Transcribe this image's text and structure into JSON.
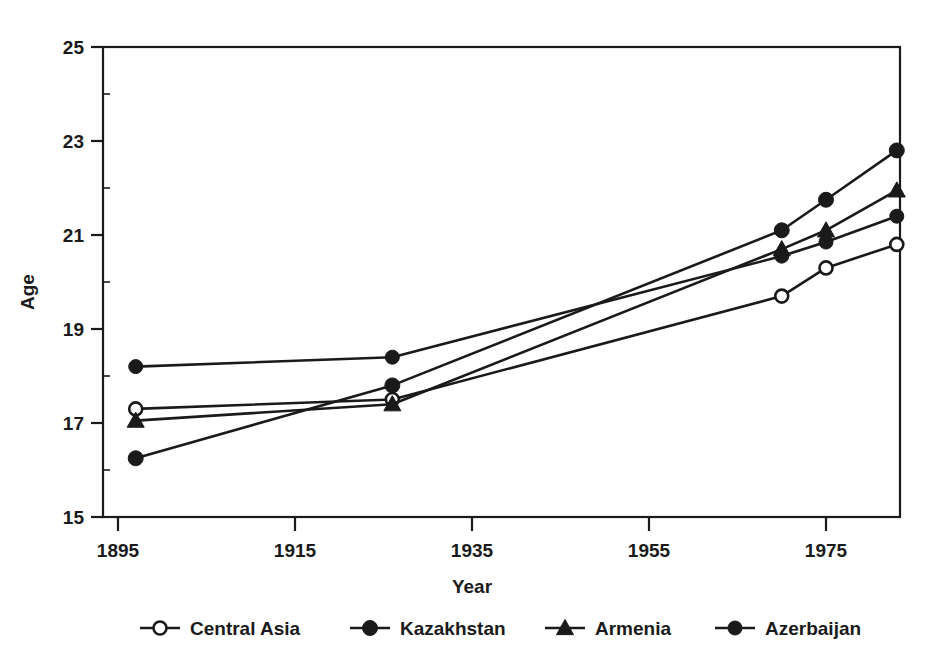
{
  "chart_data": {
    "type": "line",
    "title": "",
    "subtitle": "",
    "xlabel": "Year",
    "ylabel": "Age",
    "xlim": [
      1895,
      1985
    ],
    "ylim": [
      15,
      25
    ],
    "xticks": [
      1895,
      1915,
      1935,
      1955,
      1975
    ],
    "xtick_labels": [
      "1895",
      "1915",
      "1935",
      "1955",
      "1975"
    ],
    "yticks": [
      15,
      17,
      19,
      21,
      23,
      25
    ],
    "ytick_labels": [
      "15",
      "17",
      "19",
      "21",
      "23",
      "25"
    ],
    "grid": false,
    "legend_position": "bottom",
    "x": [
      1897,
      1926,
      1970,
      1975,
      1983
    ],
    "series": [
      {
        "name": "Central Asia",
        "marker": "open-circle",
        "values": [
          17.3,
          17.5,
          19.7,
          20.3,
          20.8
        ]
      },
      {
        "name": "Kazakhstan",
        "marker": "filled-circle",
        "values": [
          16.25,
          17.8,
          21.1,
          21.75,
          22.8
        ]
      },
      {
        "name": "Armenia",
        "marker": "filled-triangle",
        "values": [
          17.05,
          17.4,
          20.7,
          21.1,
          21.95
        ]
      },
      {
        "name": "Azerbaijan",
        "marker": "filled-circle-small",
        "values": [
          18.2,
          18.4,
          20.55,
          20.85,
          21.4
        ]
      }
    ],
    "colors": {
      "line": "#1a1a1a",
      "axis": "#1a1a1a",
      "background": "#ffffff"
    }
  },
  "legend": {
    "entries": [
      {
        "label": "Central Asia"
      },
      {
        "label": "Kazakhstan"
      },
      {
        "label": "Armenia"
      },
      {
        "label": "Azerbaijan"
      }
    ]
  }
}
